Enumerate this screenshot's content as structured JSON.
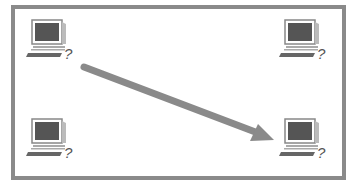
{
  "diagram": {
    "colors": {
      "frame": "#8a8a8a",
      "arrow": "#8a8a8a",
      "screen": "#555555",
      "background": "#ffffff"
    },
    "nodes": [
      {
        "id": "top-left",
        "icon": "computer-icon",
        "label": "?"
      },
      {
        "id": "top-right",
        "icon": "computer-icon",
        "label": "?"
      },
      {
        "id": "bottom-left",
        "icon": "computer-icon",
        "label": "?"
      },
      {
        "id": "bottom-right",
        "icon": "computer-icon",
        "label": "?"
      }
    ],
    "edges": [
      {
        "from": "top-left",
        "to": "bottom-right",
        "type": "arrow"
      }
    ]
  }
}
